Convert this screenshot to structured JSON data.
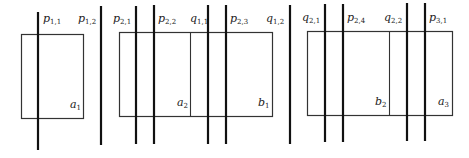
{
  "diagram": {
    "colors": {
      "line": "#111111",
      "rect": "#333333",
      "text": "#222222"
    },
    "rects": [
      {
        "name": "rect-1",
        "x": 21,
        "y": 34,
        "w": 62,
        "h": 84
      },
      {
        "name": "rect-2",
        "x": 119,
        "y": 32,
        "w": 153,
        "h": 84
      },
      {
        "name": "rect-3",
        "x": 307,
        "y": 31,
        "w": 145,
        "h": 84
      }
    ],
    "dividers": [
      {
        "name": "divider-rect-2",
        "x": 190,
        "y1": 32,
        "y2": 116
      },
      {
        "name": "divider-rect-3",
        "x": 389,
        "y1": 31,
        "y2": 115
      }
    ],
    "lines": [
      {
        "id": "p11",
        "x": 38,
        "y1": 12,
        "y2": 150
      },
      {
        "id": "p12",
        "x": 101,
        "y1": 6,
        "y2": 145
      },
      {
        "id": "p21",
        "x": 136,
        "y1": 6,
        "y2": 144
      },
      {
        "id": "p22",
        "x": 154,
        "y1": 5,
        "y2": 144
      },
      {
        "id": "q11",
        "x": 208,
        "y1": 5,
        "y2": 144
      },
      {
        "id": "p23",
        "x": 226,
        "y1": 5,
        "y2": 144
      },
      {
        "id": "q12",
        "x": 290,
        "y1": 5,
        "y2": 144
      },
      {
        "id": "q21",
        "x": 325,
        "y1": 4,
        "y2": 142
      },
      {
        "id": "p24",
        "x": 343,
        "y1": 4,
        "y2": 142
      },
      {
        "id": "q22",
        "x": 407,
        "y1": 3,
        "y2": 141
      },
      {
        "id": "p31",
        "x": 425,
        "y1": 3,
        "y2": 141
      }
    ],
    "line_labels": [
      {
        "id": "p11",
        "base": "p",
        "sub": "1,1",
        "x": 43,
        "y": 13
      },
      {
        "id": "p12",
        "base": "p",
        "sub": "1,2",
        "x": 78,
        "y": 13
      },
      {
        "id": "p21",
        "base": "p",
        "sub": "2,1",
        "x": 113,
        "y": 13
      },
      {
        "id": "p22",
        "base": "p",
        "sub": "2,2",
        "x": 158,
        "y": 13
      },
      {
        "id": "q11",
        "base": "q",
        "sub": "1,1",
        "x": 190,
        "y": 13
      },
      {
        "id": "p23",
        "base": "p",
        "sub": "2,3",
        "x": 230,
        "y": 13
      },
      {
        "id": "q12",
        "base": "q",
        "sub": "1,2",
        "x": 266,
        "y": 13
      },
      {
        "id": "q21",
        "base": "q",
        "sub": "2,1",
        "x": 302,
        "y": 12
      },
      {
        "id": "p24",
        "base": "p",
        "sub": "2,4",
        "x": 347,
        "y": 12
      },
      {
        "id": "q22",
        "base": "q",
        "sub": "2,2",
        "x": 384,
        "y": 12
      },
      {
        "id": "p31",
        "base": "p",
        "sub": "3,1",
        "x": 429,
        "y": 12
      }
    ],
    "region_labels": [
      {
        "id": "a1",
        "base": "a",
        "sub": "1",
        "x": 70,
        "y": 99
      },
      {
        "id": "a2",
        "base": "a",
        "sub": "2",
        "x": 177,
        "y": 97
      },
      {
        "id": "b1",
        "base": "b",
        "sub": "1",
        "x": 258,
        "y": 97
      },
      {
        "id": "b2",
        "base": "b",
        "sub": "2",
        "x": 375,
        "y": 96
      },
      {
        "id": "a3",
        "base": "a",
        "sub": "3",
        "x": 438,
        "y": 96
      }
    ]
  }
}
